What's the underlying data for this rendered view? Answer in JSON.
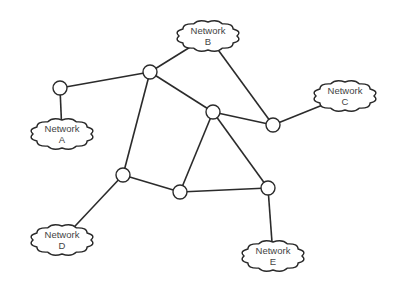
{
  "diagram": {
    "type": "network-topology",
    "routers": [
      {
        "id": "r1",
        "x": 60,
        "y": 88
      },
      {
        "id": "r2",
        "x": 150,
        "y": 72
      },
      {
        "id": "r3",
        "x": 213,
        "y": 112
      },
      {
        "id": "r4",
        "x": 273,
        "y": 125
      },
      {
        "id": "r5",
        "x": 123,
        "y": 175
      },
      {
        "id": "r6",
        "x": 180,
        "y": 192
      },
      {
        "id": "r7",
        "x": 268,
        "y": 188
      }
    ],
    "networks": [
      {
        "id": "A",
        "line1": "Network",
        "line2": "A",
        "x": 62,
        "y": 134
      },
      {
        "id": "B",
        "line1": "Network",
        "line2": "B",
        "x": 208,
        "y": 36
      },
      {
        "id": "C",
        "line1": "Network",
        "line2": "C",
        "x": 345,
        "y": 96
      },
      {
        "id": "D",
        "line1": "Network",
        "line2": "D",
        "x": 62,
        "y": 240
      },
      {
        "id": "E",
        "line1": "Network",
        "line2": "E",
        "x": 273,
        "y": 256
      }
    ],
    "links": [
      [
        "r1",
        "r2"
      ],
      [
        "r1",
        "A"
      ],
      [
        "r2",
        "B"
      ],
      [
        "r2",
        "r3"
      ],
      [
        "r2",
        "r5"
      ],
      [
        "r3",
        "r4"
      ],
      [
        "r3",
        "r6"
      ],
      [
        "r3",
        "r7"
      ],
      [
        "r4",
        "B"
      ],
      [
        "r4",
        "C"
      ],
      [
        "r5",
        "r6"
      ],
      [
        "r5",
        "D"
      ],
      [
        "r6",
        "r7"
      ],
      [
        "r7",
        "E"
      ]
    ]
  }
}
